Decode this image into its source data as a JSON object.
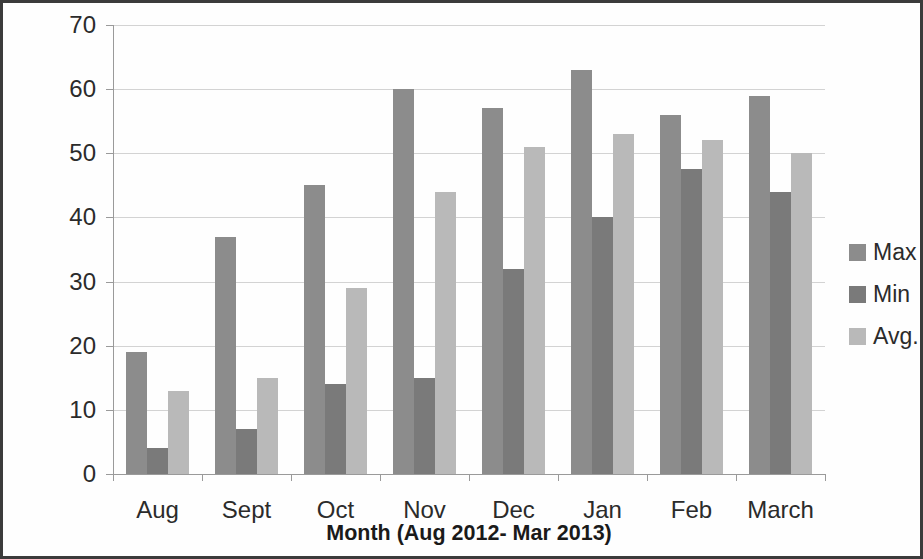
{
  "chart_data": {
    "type": "bar",
    "title": "",
    "xlabel": "Month (Aug 2012- Mar 2013)",
    "ylabel": "Concentration in µg/ m",
    "ylabel_exponent": "3",
    "categories": [
      "Aug",
      "Sept",
      "Oct",
      "Nov",
      "Dec",
      "Jan",
      "Feb",
      "March"
    ],
    "series": [
      {
        "name": "Max",
        "color": "#8c8c8c",
        "values": [
          19,
          37,
          45,
          60,
          57,
          63,
          56,
          59
        ]
      },
      {
        "name": "Min",
        "color": "#7a7a7a",
        "values": [
          4,
          7,
          14,
          15,
          32,
          40,
          47.5,
          44
        ]
      },
      {
        "name": "Avg.",
        "color": "#b9b9b9",
        "values": [
          13,
          15,
          29,
          44,
          51,
          53,
          52,
          50
        ]
      }
    ],
    "ylim": [
      0,
      70
    ],
    "ytick_step": 10,
    "yticks": [
      "0",
      "10",
      "20",
      "30",
      "40",
      "50",
      "60",
      "70"
    ],
    "grid": true,
    "legend_position": "right"
  },
  "legend": {
    "items": [
      {
        "label": "Max"
      },
      {
        "label": "Min"
      },
      {
        "label": "Avg."
      }
    ]
  }
}
